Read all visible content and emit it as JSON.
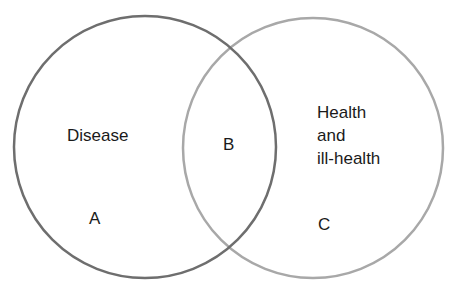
{
  "diagram": {
    "type": "venn",
    "sets": [
      {
        "name": "disease",
        "label": "Disease",
        "region_letter": "A",
        "stroke": "#6e6e6e"
      },
      {
        "name": "health",
        "label_lines": [
          "Health",
          "and",
          "ill-health"
        ],
        "region_letter": "C",
        "stroke": "#a8a8a8"
      }
    ],
    "intersection": {
      "region_letter": "B"
    }
  }
}
